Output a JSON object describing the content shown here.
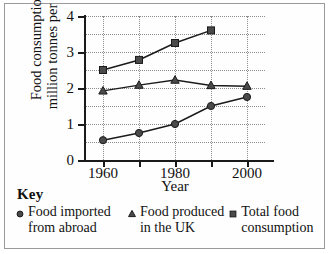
{
  "chart_data": {
    "type": "line",
    "title": "",
    "xlabel": "Year",
    "ylabel": "Food consumption / million tonnes per year",
    "ylabel_line1": "Food consumption /",
    "ylabel_line2": "million tonnes per year",
    "x": [
      1960,
      1970,
      1980,
      1990,
      2000
    ],
    "xlim": [
      1955,
      2005
    ],
    "ylim": [
      0,
      4
    ],
    "xticks": [
      1960,
      1970,
      1980,
      1990,
      2000
    ],
    "xtick_labels": [
      "1960",
      "",
      "1980",
      "",
      "2000"
    ],
    "yticks": [
      0,
      1,
      2,
      3,
      4
    ],
    "ytick_labels": [
      "0",
      "1",
      "2",
      "3",
      "4"
    ],
    "grid": true,
    "grid_y_minor_step": 0.5,
    "grid_x_step": 10,
    "legend_position": "below",
    "legend_title": "Key",
    "series": [
      {
        "name": "Food imported from abroad",
        "label_line1": "Food imported",
        "label_line2": "from abroad",
        "marker": "circle",
        "color": "#4a4a4a",
        "x": [
          1960,
          1970,
          1980,
          1990,
          2000
        ],
        "values": [
          0.55,
          0.75,
          1.0,
          1.5,
          1.75
        ]
      },
      {
        "name": "Food produced in the UK",
        "label_line1": "Food produced",
        "label_line2": "in the UK",
        "marker": "triangle",
        "color": "#4a4a4a",
        "x": [
          1960,
          1970,
          1980,
          1990,
          2000
        ],
        "values": [
          1.92,
          2.08,
          2.22,
          2.07,
          2.05
        ]
      },
      {
        "name": "Total food consumption",
        "label_line1": "Total food",
        "label_line2": "consumption",
        "marker": "square",
        "color": "#4a4a4a",
        "x": [
          1960,
          1970,
          1980,
          1990
        ],
        "values": [
          2.5,
          2.78,
          3.25,
          3.6
        ]
      }
    ]
  },
  "style": {
    "axis_color": "#1a1a1a",
    "grid_color": "#8d8d8d",
    "marker_color": "#4a4a4a",
    "line_color": "#1a1a1a",
    "border_color": "#9a9a9a",
    "background": "#ffffff"
  }
}
